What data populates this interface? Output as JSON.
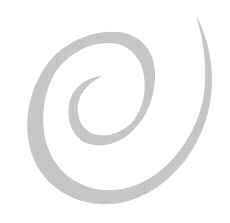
{
  "image": {
    "description": "Gray spiral on white background",
    "background_color": "#ffffff",
    "spiral_color": "#c8c8c8"
  }
}
